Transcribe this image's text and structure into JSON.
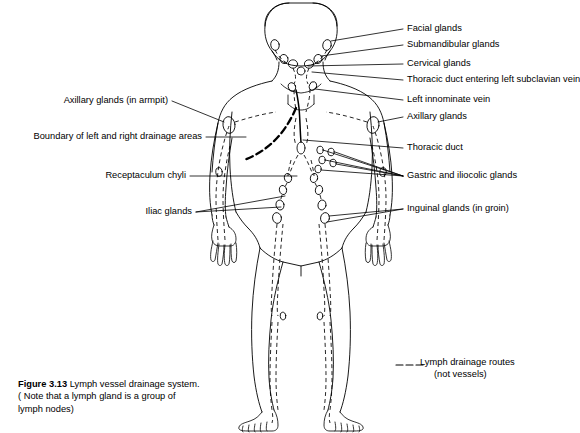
{
  "figure": {
    "number": "Figure 3.13",
    "title": "Lymph vessel drainage system.",
    "note_line1": "( Note that a lymph gland is  a group of",
    "note_line2": "lymph nodes)"
  },
  "legend": {
    "symbol": "dashed-line",
    "line1": "Lymph drainage routes",
    "line2": "(not vessels)"
  },
  "labels_right": [
    {
      "id": "facial-glands",
      "text": "Facial glands"
    },
    {
      "id": "submandibular-glands",
      "text": "Submandibular glands"
    },
    {
      "id": "cervical-glands",
      "text": "Cervical glands"
    },
    {
      "id": "thoracic-duct-subclavian",
      "text": "Thoracic duct entering left subclavian vein"
    },
    {
      "id": "left-innominate-vein",
      "text": "Left innominate vein"
    },
    {
      "id": "axillary-glands-right",
      "text": "Axillary glands"
    },
    {
      "id": "thoracic-duct",
      "text": "Thoracic duct"
    },
    {
      "id": "gastric-iliocolic-glands",
      "text": "Gastric and iliocolic glands"
    },
    {
      "id": "inguinal-glands",
      "text": "Inguinal glands (in groin)"
    }
  ],
  "labels_left": [
    {
      "id": "axillary-glands-armpit",
      "text": "Axillary glands (in armpit)"
    },
    {
      "id": "drainage-boundary",
      "text": "Boundary of left and right drainage areas"
    },
    {
      "id": "receptaculum-chyli",
      "text": "Receptaculum chyli"
    },
    {
      "id": "iliac-glands",
      "text": "Iliac glands"
    }
  ],
  "colors": {
    "ink": "#000000",
    "background": "#ffffff"
  }
}
